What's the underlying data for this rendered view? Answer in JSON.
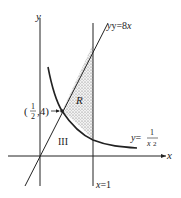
{
  "figure": {
    "axes": {
      "x_label": "x",
      "y_label": "y"
    },
    "curves": {
      "line_label_prefix": "y=8",
      "line_label_var": "x",
      "curve_label_prefix": "y=",
      "curve_label_num": "1",
      "curve_label_den": "x",
      "curve_label_exp": "2"
    },
    "vertical_line_label": "x=1",
    "region_label": "R",
    "region_iii_label": "III",
    "point_label": {
      "open": "(",
      "num": "1",
      "den": "2",
      "rest": ",4)"
    },
    "colors": {
      "ink": "#222222",
      "shade": "#8a8a8a"
    }
  }
}
